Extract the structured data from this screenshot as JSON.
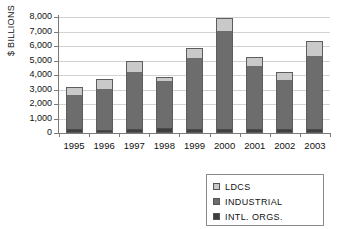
{
  "chart_data": {
    "type": "bar",
    "stacked": true,
    "title": "",
    "xlabel": "",
    "ylabel": "$ BILLIONS",
    "categories": [
      "1995",
      "1996",
      "1997",
      "1998",
      "1999",
      "2000",
      "2001",
      "2002",
      "2003"
    ],
    "series": [
      {
        "name": "LDCS",
        "color": "#c9c9c9",
        "values": [
          550,
          650,
          750,
          200,
          620,
          800,
          570,
          500,
          1000
        ]
      },
      {
        "name": "INDUSTRIAL",
        "color": "#6d6d6d",
        "values": [
          2500,
          3000,
          4100,
          3450,
          5100,
          6980,
          4520,
          3580,
          5230
        ]
      },
      {
        "name": "INTL. ORGS.",
        "color": "#3f3f3f",
        "values": [
          150,
          100,
          150,
          200,
          130,
          120,
          130,
          120,
          120
        ]
      }
    ],
    "totals": [
      3200,
      3750,
      5000,
      3850,
      5850,
      7900,
      5220,
      4200,
      6350
    ],
    "ylim": [
      0,
      8000
    ],
    "ytick_labels": [
      "8,000",
      "7,000",
      "6,000",
      "5,000",
      "4,000",
      "3,000",
      "2,000",
      "1,000",
      "0"
    ],
    "ytick_values": [
      8000,
      7000,
      6000,
      5000,
      4000,
      3000,
      2000,
      1000,
      0
    ],
    "grid": true,
    "legend_position": "bottom-right"
  },
  "legend": {
    "items": [
      {
        "label": "LDCS",
        "color": "#c9c9c9"
      },
      {
        "label": "INDUSTRIAL",
        "color": "#6d6d6d"
      },
      {
        "label": "INTL. ORGS.",
        "color": "#3f3f3f"
      }
    ]
  },
  "axis": {
    "y_title": "$ BILLIONS"
  }
}
